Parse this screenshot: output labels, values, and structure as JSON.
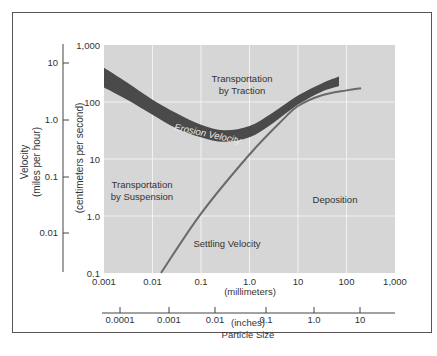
{
  "chart_data": {
    "type": "line",
    "title": "",
    "xlabel": "Particle Size",
    "x_scale": "log",
    "y_scale": "log",
    "x_axis_primary": {
      "unit_label": "(millimeters)",
      "ticks": [
        "0.001",
        "0.01",
        "0.1",
        "1.0",
        "10",
        "100",
        "1,000"
      ],
      "range": [
        0.001,
        1000
      ]
    },
    "x_axis_secondary": {
      "unit_label": "(inches)",
      "ticks": [
        "0.0001",
        "0.001",
        "0.01",
        "0.1",
        "1.0",
        "10"
      ]
    },
    "y_axis_primary": {
      "label": "(centimeters per second)",
      "ticks": [
        "0.1",
        "1.0",
        "10",
        "100",
        "1,000"
      ],
      "range": [
        0.1,
        1000
      ]
    },
    "y_axis_secondary": {
      "label": "Velocity",
      "unit_label": "(miles per hour)",
      "ticks": [
        "10",
        "1.0",
        "0.1",
        "0.01"
      ]
    },
    "grid": true,
    "series": [
      {
        "name": "Erosion Velocity",
        "style": "band",
        "x": [
          0.001,
          0.003,
          0.01,
          0.03,
          0.1,
          0.3,
          1.0,
          3.0,
          10,
          30,
          70
        ],
        "upper": [
          400,
          220,
          110,
          65,
          40,
          32,
          38,
          65,
          130,
          210,
          280
        ],
        "lower": [
          180,
          110,
          60,
          35,
          24,
          20,
          24,
          42,
          90,
          150,
          190
        ]
      },
      {
        "name": "Settling Velocity",
        "style": "line",
        "x": [
          0.015,
          0.1,
          1.0,
          5,
          10,
          30,
          100,
          200
        ],
        "y": [
          0.1,
          1.1,
          12,
          50,
          85,
          130,
          160,
          175
        ]
      }
    ],
    "annotations": [
      "Transportation by Traction",
      "Erosion Velocity",
      "Transportation by Suspension",
      "Deposition",
      "Settling Velocity"
    ]
  },
  "labels": {
    "traction_1": "Transportation",
    "traction_2": "by Traction",
    "suspension_1": "Transportation",
    "suspension_2": "by Suspension",
    "deposition": "Deposition",
    "settling": "Settling Velocity",
    "erosion": "Erosion Velocity",
    "velocity": "Velocity",
    "mph": "(miles per hour)",
    "cms": "(centimeters per second)",
    "mm": "(millimeters)",
    "inches": "(inches)",
    "particle_size": "Particle Size"
  },
  "colors": {
    "plot_bg": "#d6d6d6",
    "grid": "#f2f2f2",
    "band": "#4a4a4a",
    "settling_line": "#6a6a6a",
    "axis": "#444444"
  }
}
